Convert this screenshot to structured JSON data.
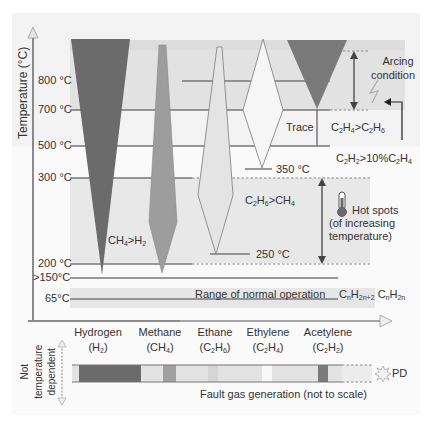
{
  "figure": {
    "y_axis_label": "Temperature (°C)",
    "temperature_ticks": [
      {
        "label": "800 °C",
        "value": 800
      },
      {
        "label": "700 °C",
        "value": 700
      },
      {
        "label": "500 °C",
        "value": 500
      },
      {
        "label": "300 °C",
        "value": 300
      },
      {
        "label": "200 °C",
        "value": 200
      },
      {
        "label": ">150°C",
        "value": 150
      },
      {
        "label": "65°C",
        "value": 65
      }
    ],
    "annotations": {
      "arcing_line1": "Arcing",
      "arcing_line2": "condition",
      "trace": "Trace",
      "c2h4_gt_c2h6": "C2H4>C2H6",
      "c2h2_gt_10pct_c2h4": "C2H2>10%C2H4",
      "t350": "350 °C",
      "t250": "250 °C",
      "c2h6_gt_ch4": "C2H6>CH4",
      "ch4_gt_h2": "CH4>H2",
      "hot_spots_line1": "Hot spots",
      "hot_spots_line2": "(of increasing",
      "hot_spots_line3": "temperature)",
      "normal_range": "Range of normal operation",
      "alkanes": "CnH2n+2",
      "alkenes": "CnH2n"
    },
    "gases": [
      {
        "name": "Hydrogen",
        "formula": "(H2)"
      },
      {
        "name": "Methane",
        "formula": "(CH4)"
      },
      {
        "name": "Ethane",
        "formula": "(C2H6)"
      },
      {
        "name": "Ethylene",
        "formula": "(C2H4)"
      },
      {
        "name": "Acetylene",
        "formula": "(C2H2)"
      }
    ],
    "bottom": {
      "not_temp_dependent_line1": "Not",
      "not_temp_dependent_line2": "temperature",
      "not_temp_dependent_line3": "dependent",
      "pd_label": "PD",
      "caption": "Fault gas generation (not to scale)"
    },
    "colors": {
      "hydrogen": "#6b6b6b",
      "methane": "#9d9d9d",
      "ethane": "#e4e4e4",
      "ethylene": "#f6f6f6",
      "acetylene": "#7a7a7a",
      "band": "#e6e6e6",
      "line": "#777777"
    }
  }
}
